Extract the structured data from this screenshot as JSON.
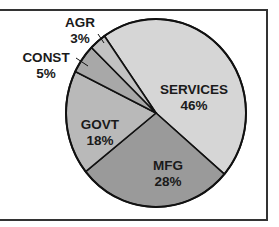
{
  "chart_data": {
    "type": "pie",
    "title": "",
    "categories": [
      "SERVICES",
      "MFG",
      "GOVT",
      "CONST",
      "AGR"
    ],
    "values": [
      46,
      28,
      18,
      5,
      3
    ],
    "value_labels": [
      "46%",
      "28%",
      "18%",
      "5%",
      "3%"
    ],
    "colors": [
      "#d6d6d6",
      "#9a9a9a",
      "#b9b9b9",
      "#a8a8a8",
      "#c2c2c2"
    ],
    "start_angle_deg": -35,
    "direction": "clockwise",
    "legend": "none (direct labels)",
    "leader_lines": [
      "CONST",
      "AGR"
    ]
  },
  "frame": {
    "border_color": "#333333"
  }
}
